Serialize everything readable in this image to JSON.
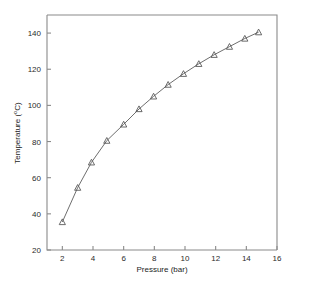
{
  "chart_data": {
    "type": "line",
    "title": "",
    "xlabel": "Pressure (bar)",
    "ylabel": "Temperature (°C)",
    "ylabel_text": "Temperature (",
    "ylabel_sup": "o",
    "ylabel_tail": "C)",
    "xlim": [
      1,
      16
    ],
    "ylim": [
      20,
      150
    ],
    "xticks": [
      2,
      4,
      6,
      8,
      10,
      12,
      14,
      16
    ],
    "yticks": [
      20,
      40,
      60,
      80,
      100,
      120,
      140
    ],
    "xticklabels": [
      "2",
      "4",
      "6",
      "8",
      "10",
      "12",
      "14",
      "16"
    ],
    "yticklabels": [
      "20",
      "40",
      "60",
      "80",
      "100",
      "120",
      "140"
    ],
    "grid": false,
    "legend": null,
    "marker": "triangle-up",
    "line_color": "#6e6e6e",
    "marker_color": "#5a5a5a",
    "axis_color": "#8a8a8a",
    "background": "#ffffff",
    "x": [
      2.0,
      3.0,
      3.9,
      4.9,
      6.0,
      7.0,
      7.95,
      8.9,
      9.9,
      10.9,
      11.9,
      12.9,
      13.9,
      14.8
    ],
    "y": [
      35.5,
      54.5,
      68.5,
      80.5,
      89.5,
      98.0,
      105.0,
      111.5,
      117.5,
      123.0,
      128.0,
      132.5,
      137.0,
      140.5
    ],
    "series": [
      {
        "name": "Saturation curve",
        "x": [
          2.0,
          3.0,
          3.9,
          4.9,
          6.0,
          7.0,
          7.95,
          8.9,
          9.9,
          10.9,
          11.9,
          12.9,
          13.9,
          14.8
        ],
        "values": [
          35.5,
          54.5,
          68.5,
          80.5,
          89.5,
          98.0,
          105.0,
          111.5,
          117.5,
          123.0,
          128.0,
          132.5,
          137.0,
          140.5
        ]
      }
    ]
  }
}
